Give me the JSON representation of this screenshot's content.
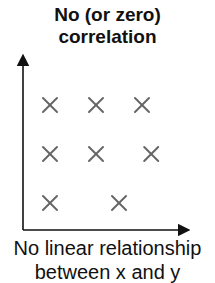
{
  "title_line1": "No (or zero)",
  "title_line2": "correlation",
  "caption_line1": "No linear relationship",
  "caption_line2": "between x and y",
  "colors": {
    "axis": "#111111",
    "marker": "#666666",
    "text": "#111111"
  },
  "chart_data": {
    "type": "scatter",
    "title": "No (or zero) correlation",
    "xlabel": "",
    "ylabel": "",
    "marker": "x",
    "grid": false,
    "points": [
      {
        "x": 1,
        "y": 3
      },
      {
        "x": 2,
        "y": 3
      },
      {
        "x": 3,
        "y": 3
      },
      {
        "x": 1,
        "y": 2
      },
      {
        "x": 2,
        "y": 2
      },
      {
        "x": 3.2,
        "y": 2
      },
      {
        "x": 1,
        "y": 1
      },
      {
        "x": 2.5,
        "y": 1
      }
    ],
    "annotation": "No linear relationship between x and y"
  }
}
